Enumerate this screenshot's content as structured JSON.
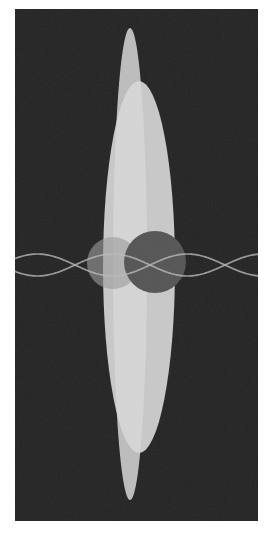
{
  "canvas": {
    "width": 273,
    "height": 542,
    "page_background": "#ffffff",
    "title": "Abstract Composition"
  },
  "plot_area": {
    "label": "dark panel",
    "x": 15,
    "y": 9,
    "width": 243,
    "height": 512,
    "fill": "#232323",
    "border": "none"
  },
  "chart_data": {
    "type": "scatter",
    "subtitle": "",
    "xlabel": "",
    "ylabel": "",
    "xlim": [
      0,
      273
    ],
    "ylim": [
      0,
      542
    ],
    "grid": false,
    "legend": "none",
    "background": "#232323",
    "shapes": [
      {
        "name": "outer-ellipse",
        "kind": "ellipse",
        "cx": 139,
        "cy": 267,
        "rx": 36,
        "ry": 186,
        "fill": "#c7c7c7",
        "opacity": 1,
        "rotation": 0
      },
      {
        "name": "inner-ellipse",
        "kind": "ellipse",
        "cx": 130,
        "cy": 264,
        "rx": 17,
        "ry": 236,
        "fill": "#d6d6d6",
        "opacity": 0.85,
        "rotation": 0
      },
      {
        "name": "left-circle",
        "kind": "circle",
        "cx": 113,
        "cy": 263,
        "r": 26,
        "fill": "#9a9a9a",
        "opacity": 0.62
      },
      {
        "name": "right-circle",
        "kind": "circle",
        "cx": 155,
        "cy": 262,
        "r": 31,
        "fill": "#565656",
        "opacity": 1
      }
    ],
    "curves": [
      {
        "name": "sine-wave-a",
        "kind": "sine",
        "amplitude": 11,
        "wavelength": 150,
        "phase": 0,
        "baseline_y": 265,
        "x_start": 0,
        "x_end": 273,
        "stroke": "#b9b9b9",
        "stroke_width": 1.7,
        "opacity": 0.78
      },
      {
        "name": "sine-wave-b",
        "kind": "sine",
        "amplitude": 11,
        "wavelength": 150,
        "phase": 3.14159,
        "baseline_y": 265,
        "x_start": 0,
        "x_end": 273,
        "stroke": "#b9b9b9",
        "stroke_width": 1.7,
        "opacity": 0.78
      }
    ],
    "palette": {
      "background": "#232323",
      "ellipse_light": "#c7c7c7",
      "ellipse_bright": "#d6d6d6",
      "circle_light": "#9a9a9a",
      "circle_dark": "#565656",
      "wave": "#b9b9b9"
    }
  }
}
